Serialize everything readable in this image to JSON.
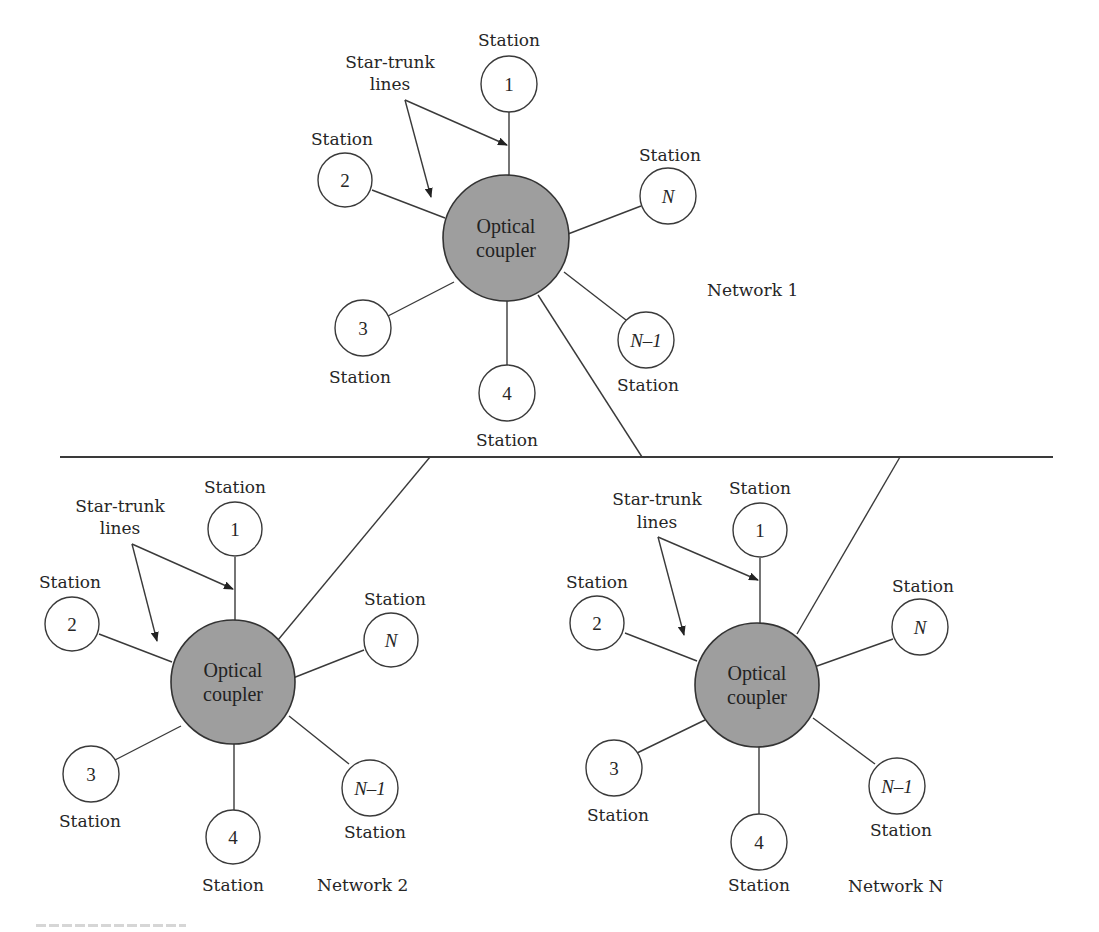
{
  "figure": {
    "bus_label": "",
    "networks": [
      {
        "id": "network-1",
        "label": "Network 1",
        "coupler_line1": "Optical",
        "coupler_line2": "coupler",
        "annotation_line1": "Star-trunk",
        "annotation_line2": "lines",
        "stations": [
          {
            "num": "1",
            "label": "Station"
          },
          {
            "num": "2",
            "label": "Station"
          },
          {
            "num": "N",
            "label": "Station"
          },
          {
            "num": "3",
            "label": "Station"
          },
          {
            "num": "4",
            "label": "Station"
          },
          {
            "num": "N–1",
            "label": "Station"
          }
        ]
      },
      {
        "id": "network-2",
        "label": "Network 2",
        "coupler_line1": "Optical",
        "coupler_line2": "coupler",
        "annotation_line1": "Star-trunk",
        "annotation_line2": "lines",
        "stations": [
          {
            "num": "1",
            "label": "Station"
          },
          {
            "num": "2",
            "label": "Station"
          },
          {
            "num": "N",
            "label": "Station"
          },
          {
            "num": "3",
            "label": "Station"
          },
          {
            "num": "4",
            "label": "Station"
          },
          {
            "num": "N–1",
            "label": "Station"
          }
        ]
      },
      {
        "id": "network-n",
        "label": "Network N",
        "coupler_line1": "Optical",
        "coupler_line2": "coupler",
        "annotation_line1": "Star-trunk",
        "annotation_line2": "lines",
        "stations": [
          {
            "num": "1",
            "label": "Station"
          },
          {
            "num": "2",
            "label": "Station"
          },
          {
            "num": "N",
            "label": "Station"
          },
          {
            "num": "3",
            "label": "Station"
          },
          {
            "num": "4",
            "label": "Station"
          },
          {
            "num": "N–1",
            "label": "Station"
          }
        ]
      }
    ],
    "colors": {
      "coupler_fill": "#9e9e9e",
      "line": "#3a3a3a",
      "background": "#ffffff"
    }
  }
}
